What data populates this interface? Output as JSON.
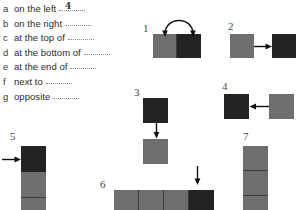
{
  "exercise": {
    "items": [
      {
        "letter": "a",
        "phrase": "on the left",
        "answer": "4"
      },
      {
        "letter": "b",
        "phrase": "on the right",
        "answer": ""
      },
      {
        "letter": "c",
        "phrase": "at the top of",
        "answer": ""
      },
      {
        "letter": "d",
        "phrase": "at the bottom of",
        "answer": ""
      },
      {
        "letter": "e",
        "phrase": "at the end of",
        "answer": ""
      },
      {
        "letter": "f",
        "phrase": "next to",
        "answer": ""
      },
      {
        "letter": "g",
        "phrase": "opposite",
        "answer": ""
      }
    ]
  },
  "figures": {
    "one": {
      "number": "1",
      "arrow": "curved-arrow-over-pair"
    },
    "two": {
      "number": "2",
      "arrow": "arrow-right"
    },
    "three": {
      "number": "3",
      "arrow": "arrow-down"
    },
    "four": {
      "number": "4",
      "arrow": "arrow-left"
    },
    "five": {
      "number": "5",
      "arrow": "arrow-right-into-stack-top"
    },
    "six": {
      "number": "6",
      "arrow": "arrow-down-onto-last-cell"
    },
    "seven": {
      "number": "7",
      "arrow": "none"
    }
  },
  "colors": {
    "gray_block": "#6e6e6e",
    "dark_block": "#232323",
    "ink": "#111111",
    "text": "#2b2b2b",
    "blank_line": "#8d8d8d"
  }
}
